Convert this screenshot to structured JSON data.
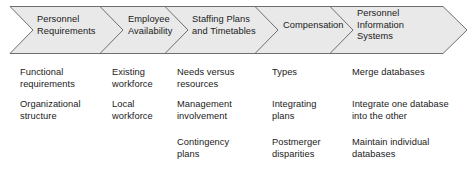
{
  "diagram": {
    "type": "chevron-process-flow",
    "stage_count": 5,
    "colors": {
      "banner_fill": "#e9e9e9",
      "banner_stroke": "#6e6e6e",
      "text": "#1a1a1a",
      "background": "#ffffff"
    }
  },
  "banner": {
    "stages": [
      {
        "label": "Personnel\nRequirements"
      },
      {
        "label": "Employee\nAvailability"
      },
      {
        "label": "Staffing Plans\nand Timetables"
      },
      {
        "label": "Compensation"
      },
      {
        "label": "Personnel\nInformation\nSystems"
      }
    ]
  },
  "details": {
    "columns": [
      {
        "stage": "Personnel Requirements",
        "items": [
          "Functional\nrequirements",
          "Organizational\nstructure"
        ]
      },
      {
        "stage": "Employee Availability",
        "items": [
          "Existing\nworkforce",
          "Local\nworkforce"
        ]
      },
      {
        "stage": "Staffing Plans and Timetables",
        "items": [
          "Needs versus\nresources",
          "Management\ninvolvement",
          "Contingency\nplans"
        ]
      },
      {
        "stage": "Compensation",
        "items": [
          "Types",
          "Integrating\nplans",
          "Postmerger\ndisparities"
        ]
      },
      {
        "stage": "Personnel Information Systems",
        "items": [
          "Merge databases",
          "Integrate one database\ninto the other",
          "Maintain individual\ndatabases"
        ]
      }
    ]
  }
}
